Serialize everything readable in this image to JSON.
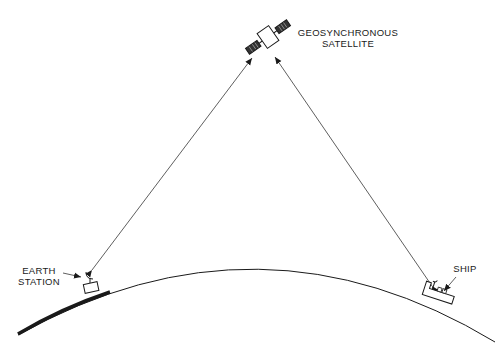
{
  "diagram": {
    "type": "satellite-communication-link",
    "labels": {
      "satellite_line1": "GEOSYNCHRONOUS",
      "satellite_line2": "SATELLITE",
      "earth_station_line1": "EARTH",
      "earth_station_line2": "STATION",
      "ship": "SHIP"
    },
    "nodes": [
      {
        "id": "satellite",
        "label": "GEOSYNCHRONOUS SATELLITE"
      },
      {
        "id": "earth-station",
        "label": "EARTH STATION"
      },
      {
        "id": "ship",
        "label": "SHIP"
      }
    ],
    "links": [
      {
        "from": "earth-station",
        "to": "satellite",
        "bidirectional": true
      },
      {
        "from": "ship",
        "to": "satellite",
        "bidirectional": true
      }
    ],
    "colors": {
      "ink": "#1a1a1a",
      "background": "#ffffff"
    }
  }
}
